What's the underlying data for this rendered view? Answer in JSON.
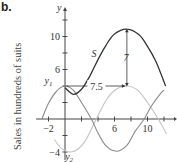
{
  "figure_label": "b.",
  "chart_data": {
    "type": "line",
    "title": "",
    "xlabel": "t",
    "ylabel": "Sales in hundreds of suits",
    "axis_y_label": "y",
    "xlim": [
      -3.5,
      13.5
    ],
    "ylim": [
      -5,
      13.5
    ],
    "x_ticks": [
      -2,
      0,
      2,
      4,
      6,
      8,
      10,
      12
    ],
    "x_tick_labels": [
      {
        "value": -2,
        "label": "-2"
      },
      {
        "value": 6,
        "label": "6"
      },
      {
        "value": 10,
        "label": "10"
      }
    ],
    "y_ticks": [
      -4,
      -2,
      2,
      4,
      6,
      8,
      10,
      12
    ],
    "y_tick_labels": [
      {
        "value": 10,
        "label": "10"
      },
      {
        "value": 6,
        "label": "6"
      },
      {
        "value": -4,
        "label": "-4"
      }
    ],
    "grid": false,
    "series": [
      {
        "name": "S",
        "color": "#333333",
        "points": [
          [
            0,
            3.8
          ],
          [
            1,
            3.0
          ],
          [
            2,
            3.6
          ],
          [
            3,
            5.2
          ],
          [
            4,
            7.2
          ],
          [
            5,
            9.0
          ],
          [
            6,
            10.3
          ],
          [
            7.5,
            10.9
          ],
          [
            9,
            10.2
          ],
          [
            10,
            8.8
          ],
          [
            11,
            7.0
          ],
          [
            12.2,
            4.0
          ]
        ]
      },
      {
        "name": "y1",
        "color": "#8a8a8a",
        "points": [
          [
            -2.8,
            0
          ],
          [
            -2,
            1.9
          ],
          [
            -1,
            3.4
          ],
          [
            0,
            4.0
          ],
          [
            1,
            3.5
          ],
          [
            2,
            2.0
          ],
          [
            3.2,
            0
          ],
          [
            4,
            -1.7
          ],
          [
            5,
            -3.3
          ],
          [
            6.3,
            -3.9
          ],
          [
            7.5,
            -3.2
          ],
          [
            8.5,
            -1.5
          ],
          [
            9.6,
            0
          ],
          [
            10.5,
            1.6
          ],
          [
            11.5,
            3.0
          ],
          [
            12,
            3.5
          ]
        ]
      },
      {
        "name": "y2",
        "color": "#c4c4c4",
        "points": [
          [
            -1.3,
            -2.5
          ],
          [
            -0.5,
            -3.5
          ],
          [
            0.5,
            -4.0
          ],
          [
            1.5,
            -3.7
          ],
          [
            2.5,
            -2.6
          ],
          [
            3.8,
            0
          ],
          [
            5,
            2.3
          ],
          [
            6.2,
            3.6
          ],
          [
            7.5,
            4.0
          ],
          [
            8.8,
            3.5
          ],
          [
            10,
            2.0
          ],
          [
            11.3,
            0
          ],
          [
            12.3,
            -1.8
          ]
        ]
      }
    ],
    "annotations": [
      {
        "text": "S",
        "near": [
          3.5,
          7.5
        ]
      },
      {
        "text": "y1",
        "near": [
          -2,
          4.2
        ]
      },
      {
        "text": "y2",
        "near": [
          0.5,
          -5
        ]
      },
      {
        "text": "7",
        "type": "vertical-arrow",
        "from": [
          7.5,
          4
        ],
        "to": [
          7.5,
          11
        ],
        "meaning": "amplitude/vertical distance"
      },
      {
        "text": "7.5",
        "type": "horizontal-arrow",
        "from": [
          0,
          4
        ],
        "to": [
          7.5,
          4
        ],
        "meaning": "horizontal shift"
      }
    ]
  }
}
